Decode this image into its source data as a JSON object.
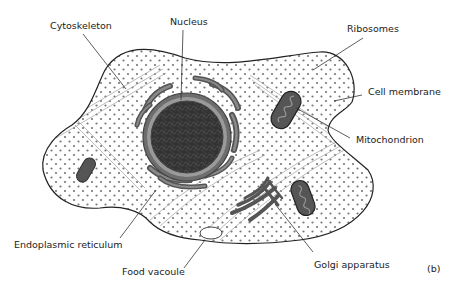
{
  "diagram": {
    "type": "animal-cell",
    "panel_label": "(b)",
    "labels": {
      "cytoskeleton": "Cytoskeleton",
      "nucleus": "Nucleus",
      "ribosomes": "Ribosomes",
      "cell_membrane": "Cell membrane",
      "mitochondrion": "Mitochondrion",
      "endoplasmic_reticulum": "Endoplasmic reticulum",
      "food_vacuole": "Food vacoule",
      "golgi_apparatus": "Golgi apparatus"
    },
    "colors": {
      "outline": "#222222",
      "organelle_fill": "#555555",
      "organelle_light": "#8a8a8a",
      "nucleus_dark": "#2e2e2e",
      "ribosome_dot": "#777777",
      "cytoskeleton_line": "#aaaaaa"
    }
  }
}
